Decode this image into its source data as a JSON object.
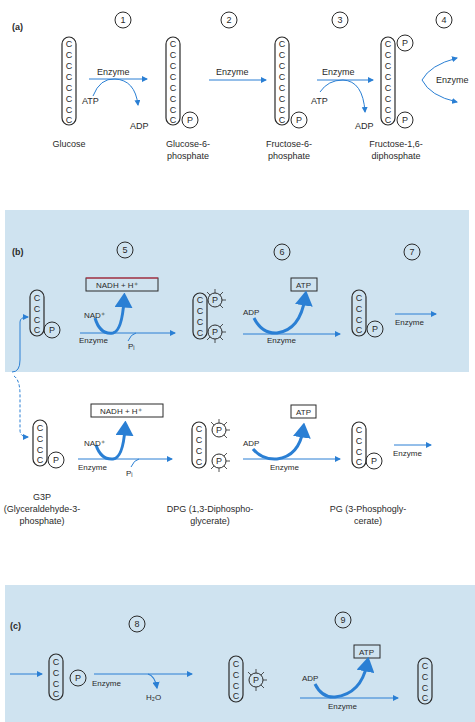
{
  "colors": {
    "panel_bg": "#cfe3f0",
    "arrow": "#2a7fd4",
    "ink": "#2a2a2a",
    "box_top_accent": "#d9304a"
  },
  "panel_a": {
    "label": "(a)",
    "steps": [
      "1",
      "2",
      "3",
      "4"
    ],
    "enzyme": "Enzyme",
    "atp": "ATP",
    "adp": "ADP",
    "phosphate": "P",
    "carbon": "C",
    "captions": {
      "glucose": "Glucose",
      "g6p_1": "Glucose-6-",
      "g6p_2": "phosphate",
      "f6p_1": "Fructose-6-",
      "f6p_2": "phosphate",
      "f16dp_1": "Fructose-1,6-",
      "f16dp_2": "diphosphate"
    }
  },
  "panel_b": {
    "label": "(b)",
    "steps": [
      "5",
      "6",
      "7"
    ],
    "nadh_box": "NADH + H⁺",
    "nad": "NAD⁺",
    "pi": "Pᵢ",
    "atp_box": "ATP",
    "adp": "ADP",
    "enzyme": "Enzyme",
    "captions": {
      "g3p_1": "G3P",
      "g3p_2": "(Glyceraldehyde-3-",
      "g3p_3": "phosphate)",
      "dpg_1": "DPG (1,3-Diphospho-",
      "dpg_2": "glycerate)",
      "pg_1": "PG (3-Phosphogly-",
      "pg_2": "cerate)"
    }
  },
  "panel_c": {
    "label": "(c)",
    "steps": [
      "8",
      "9"
    ],
    "enzyme": "Enzyme",
    "h2o": "H₂O",
    "atp_box": "ATP",
    "adp": "ADP"
  }
}
